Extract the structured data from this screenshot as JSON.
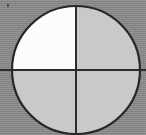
{
  "figure": {
    "background_color": "#8a8a8a",
    "outline_color": "#262626",
    "line_color": "#2b2b2b",
    "shaded_quadrant_color": "#fdfdfd",
    "unshaded_quadrant_color": "#c9c9c9",
    "circle": {
      "center_x": 76,
      "center_y": 70,
      "radius": 64,
      "stroke_width": 2
    },
    "crosshair": {
      "vertical_x": 76,
      "vertical_y_start": 6,
      "vertical_y_end": 135,
      "horizontal_y": 70,
      "horizontal_x_start": 0,
      "horizontal_x_end": 146,
      "stroke_width": 2
    },
    "quadrants": [
      {
        "name": "upper-left",
        "label": "1",
        "fill": "#fdfdfd",
        "shaded": "true",
        "fraction": "1/4"
      },
      {
        "name": "upper-right",
        "label": "2",
        "fill": "#c9c9c9",
        "shaded": "false",
        "fraction": "1/4"
      },
      {
        "name": "lower-left",
        "label": "3",
        "fill": "#c9c9c9",
        "shaded": "false",
        "fraction": "1/4"
      },
      {
        "name": "lower-right",
        "label": "4",
        "fill": "#c9c9c9",
        "shaded": "false",
        "fraction": "1/4"
      }
    ],
    "artifacts": [
      {
        "name": "corner-speck",
        "x": 7,
        "y": 4,
        "width": 2,
        "height": 3
      }
    ]
  },
  "chart_data": {
    "type": "pie",
    "categories": [
      "upper-left",
      "upper-right",
      "lower-left",
      "lower-right"
    ],
    "values": [
      25,
      25,
      25,
      25
    ],
    "colors": [
      "#fdfdfd",
      "#c9c9c9",
      "#c9c9c9",
      "#c9c9c9"
    ],
    "shaded_count": 1,
    "total_parts": 4,
    "fraction_shaded": "1/4",
    "xlabel": "",
    "ylabel": "",
    "legend": "none",
    "grid": "off",
    "annotations": []
  }
}
